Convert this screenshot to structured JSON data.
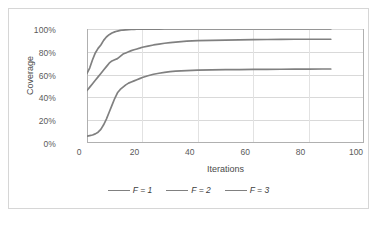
{
  "chart_data": {
    "type": "line",
    "title": "",
    "xlabel": "Iterations",
    "ylabel": "Coverage",
    "xlim": [
      0,
      100
    ],
    "ylim": [
      0,
      1.0
    ],
    "grid": true,
    "legend_position": "bottom",
    "x_ticks": [
      "0",
      "20",
      "40",
      "60",
      "80",
      "100"
    ],
    "x_tick_values": [
      0,
      20,
      40,
      60,
      80,
      100
    ],
    "y_ticks": [
      "0%",
      "20%",
      "40%",
      "60%",
      "80%",
      "100%"
    ],
    "y_tick_values": [
      0,
      20,
      40,
      60,
      80,
      100
    ],
    "x": [
      0,
      1,
      2,
      3,
      4,
      5,
      6,
      7,
      8,
      9,
      10,
      11,
      12,
      13,
      14,
      15,
      16,
      17,
      18,
      19,
      20,
      22,
      24,
      26,
      28,
      30,
      32,
      34,
      36,
      38,
      40,
      45,
      50,
      55,
      60,
      65,
      70,
      75,
      80,
      85,
      88
    ],
    "series": [
      {
        "name": "F = 1",
        "color": "#808080",
        "values": [
          61,
          66,
          73,
          79,
          83,
          86,
          90,
          93,
          95,
          96.5,
          97.5,
          98.2,
          98.8,
          99.1,
          99.3,
          99.5,
          99.6,
          99.7,
          99.8,
          99.85,
          99.9,
          99.93,
          99.95,
          99.97,
          99.98,
          99.99,
          100,
          100,
          100,
          100,
          100,
          100,
          100,
          100,
          100,
          100,
          100,
          100,
          100,
          100,
          100
        ]
      },
      {
        "name": "F = 2",
        "color": "#808080",
        "values": [
          46,
          49,
          52,
          55,
          58,
          61,
          64,
          67,
          70,
          72,
          73,
          74,
          76,
          78,
          79,
          80,
          81,
          81.8,
          82.5,
          83.2,
          84,
          85,
          86,
          86.8,
          87.5,
          88,
          88.5,
          89,
          89.3,
          89.6,
          89.8,
          90.1,
          90.3,
          90.5,
          90.7,
          90.8,
          90.9,
          91,
          91,
          91,
          91
        ]
      },
      {
        "name": "F = 3",
        "color": "#808080",
        "values": [
          6,
          6.5,
          7,
          8,
          9.5,
          12,
          16,
          21,
          27,
          33,
          39,
          44,
          47,
          49,
          51,
          52.5,
          53.5,
          54.5,
          55.5,
          56.5,
          57.5,
          59,
          60.3,
          61.2,
          62,
          62.6,
          63,
          63.3,
          63.5,
          63.7,
          63.9,
          64.1,
          64.3,
          64.4,
          64.5,
          64.6,
          64.7,
          64.8,
          64.8,
          64.9,
          64.9
        ]
      }
    ]
  },
  "legend": {
    "items": [
      {
        "label": "F = 1"
      },
      {
        "label": "F = 2"
      },
      {
        "label": "F = 3"
      }
    ]
  }
}
